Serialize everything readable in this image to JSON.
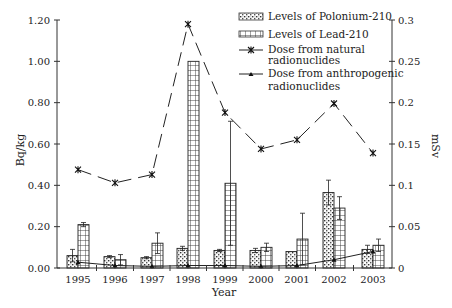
{
  "chart_data": {
    "type": "bar",
    "title": "",
    "xlabel": "Year",
    "ylabel": "Bq/kg",
    "y2label": "mSv",
    "ylim": [
      0,
      1.2
    ],
    "y2lim": [
      0,
      0.3
    ],
    "yticks": [
      "0.00",
      "0.20",
      "0.40",
      "0.60",
      "0.80",
      "1.00",
      "1.20"
    ],
    "y2ticks": [
      "0",
      "0.05",
      "0.1",
      "0.15",
      "0.2",
      "0.25",
      "0.3"
    ],
    "categories": [
      "1995",
      "1996",
      "1997",
      "1998",
      "1999",
      "2000",
      "2001",
      "2002",
      "2003"
    ],
    "legend_position": "top-right",
    "series": [
      {
        "name": "Levels of Polonium-210",
        "type": "bar",
        "axis": "left",
        "pattern": "dotted",
        "values": [
          0.06,
          0.055,
          0.05,
          0.095,
          0.085,
          0.085,
          0.08,
          0.365,
          0.09
        ],
        "error": [
          0.03,
          0.005,
          0.005,
          0.01,
          0.005,
          0.01,
          0.0,
          0.06,
          0.02
        ]
      },
      {
        "name": "Levels of Lead-210",
        "type": "bar",
        "axis": "left",
        "pattern": "grid",
        "values": [
          0.21,
          0.04,
          0.12,
          1.0,
          0.41,
          0.1,
          0.14,
          0.29,
          0.11
        ],
        "error": [
          0.01,
          0.025,
          0.05,
          0.0,
          0.3,
          0.02,
          0.125,
          0.055,
          0.03
        ]
      },
      {
        "name": "Dose from natural radionuclides",
        "type": "line",
        "axis": "right",
        "marker": "asterisk",
        "dashed": true,
        "values": [
          0.119,
          0.103,
          0.113,
          0.295,
          0.188,
          0.144,
          0.155,
          0.199,
          0.139
        ]
      },
      {
        "name": "Dose from anthropogenic radionuclides",
        "type": "line",
        "axis": "right",
        "marker": "triangle",
        "dashed": false,
        "values": [
          0.007,
          0.003,
          0.002,
          0.003,
          0.003,
          0.002,
          0.003,
          0.01,
          0.02
        ]
      }
    ]
  },
  "legend": {
    "items": [
      {
        "label": "Levels of Polonium-210"
      },
      {
        "label": "Levels of Lead-210"
      },
      {
        "label_line1": "Dose from natural",
        "label_line2": "radionuclides"
      },
      {
        "label_line1": "Dose from anthropogenic",
        "label_line2": "radionuclides"
      }
    ]
  },
  "axes": {
    "x_title": "Year",
    "y_left_title": "Bq/kg",
    "y_right_title": "mSv"
  },
  "colors": {
    "ink": "#222222",
    "background": "#ffffff"
  }
}
